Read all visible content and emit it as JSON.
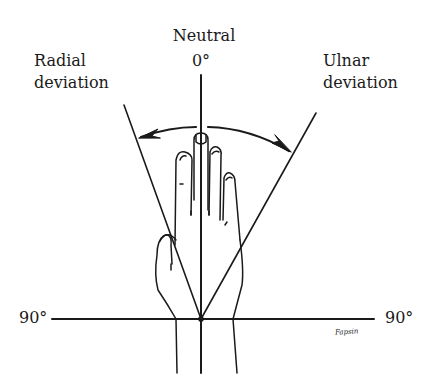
{
  "figure": {
    "labels": {
      "neutral": "Neutral",
      "neutral_angle": "0°",
      "radial_line1": "Radial",
      "radial_line2": "deviation",
      "ulnar_line1": "Ulnar",
      "ulnar_line2": "deviation",
      "left_angle": "90°",
      "right_angle": "90°"
    },
    "signature": "Fapsin",
    "colors": {
      "ink": "#1a1a1a",
      "background": "#ffffff"
    }
  }
}
